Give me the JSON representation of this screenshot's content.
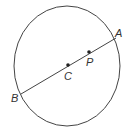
{
  "diagram": {
    "type": "geometry",
    "stroke_color": "#444444",
    "circle": {
      "cx": 67,
      "cy": 66,
      "rx": 53,
      "ry": 60
    },
    "segment": {
      "from": "B",
      "to": "A"
    },
    "points": [
      {
        "id": "A",
        "label": "A",
        "x": 116,
        "y": 38,
        "label_x": 115,
        "label_y": 37,
        "dot": false
      },
      {
        "id": "B",
        "label": "B",
        "x": 21,
        "y": 94,
        "label_x": 11,
        "label_y": 102,
        "dot": false
      },
      {
        "id": "C",
        "label": "C",
        "x": 68,
        "y": 65,
        "label_x": 64,
        "label_y": 80,
        "dot": true
      },
      {
        "id": "P",
        "label": "P",
        "x": 89,
        "y": 52,
        "label_x": 86,
        "label_y": 66,
        "dot": true
      }
    ]
  }
}
